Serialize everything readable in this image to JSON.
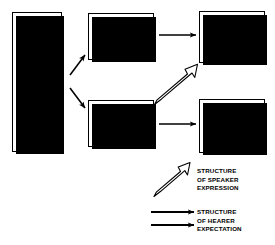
{
  "diagram": {
    "nodes": {
      "doorkeeper": {
        "label": "DOOR-\nKEEPER\n[LAW?]\n(G)"
      },
      "admittance": {
        "label": "ADMITTANCE\n(O +)"
      },
      "no_admittance": {
        "label": "NO\nADMITTANCE\n(O - )"
      },
      "intended": {
        "label": "THOSE FOR\n(R +) WHOM\nDOOR WAS\nINTENDED"
      },
      "not_intended": {
        "label": "THOSE FOR\n(R - ) WHOM\nDOOR WAS\nNOT INTENDED"
      }
    },
    "legend": {
      "speaker": {
        "label": "STRUCTURE\nOF SPEAKER\nEXPRESSION",
        "arrow_style": "hollow-outline-diagonal"
      },
      "hearer": {
        "label": "STRUCTURE\nOF HEARER\nEXPECTATION",
        "arrow_style": "solid-filled-horizontal"
      }
    },
    "colors": {
      "stroke": "#000000",
      "fill": "#ffffff",
      "shadow": "#000000"
    }
  }
}
